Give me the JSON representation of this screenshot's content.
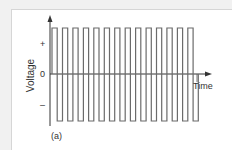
{
  "chart_data": {
    "type": "line",
    "subtype": "square-wave",
    "title": "",
    "panel_label": "(a)",
    "xlabel": "Time",
    "ylabel": "Voltage",
    "y_tick_labels": [
      "+",
      "0",
      "–"
    ],
    "levels": {
      "high": 1,
      "zero": 0,
      "low": -1
    },
    "cycles": 14,
    "grid": false,
    "legend": null,
    "line_color": "#6b6b6b",
    "axis_color": "#333333"
  },
  "labels": {
    "ylabel": "Voltage",
    "xlabel": "Time",
    "plus": "+",
    "zero": "0",
    "minus": "–",
    "panel": "(a)"
  }
}
